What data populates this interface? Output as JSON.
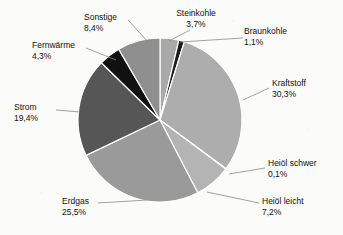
{
  "chart_data": {
    "type": "pie",
    "title": "",
    "subtitle": "",
    "xlabel": "",
    "ylabel": "",
    "grid": false,
    "legend_position": "none",
    "labels_outside": true,
    "start_angle_deg": 0,
    "direction": "clockwise",
    "unit": "%",
    "decimal_separator": ",",
    "categories": [
      "Steinkohle",
      "Braunkohle",
      "Kraftstoff",
      "Heiöl schwer",
      "Heiöl leicht",
      "Erdgas",
      "Strom",
      "Fernwärme",
      "Sonstige"
    ],
    "values": [
      3.7,
      1.1,
      30.3,
      0.1,
      7.2,
      25.5,
      19.4,
      4.3,
      8.4
    ],
    "value_labels": [
      "3,7%",
      "1,1%",
      "30,3%",
      "0,1%",
      "7,2%",
      "25,5%",
      "19,4%",
      "4,3%",
      "8,4%"
    ],
    "colors": [
      "#a9a9a9",
      "#1c1c1c",
      "#adadad",
      "#c8c8c8",
      "#b4b4b4",
      "#9a9a9a",
      "#565656",
      "#111111",
      "#8f8f8f"
    ],
    "slice_border_color": "#ffffff",
    "leader_line_color": "#8a8a8a",
    "total": 100.1
  },
  "slices": [
    {
      "name": "Steinkohle",
      "value_label": "3,7%",
      "color": "#a9a9a9",
      "label_pos": {
        "left": 196,
        "top": 8,
        "align": "center"
      },
      "leader": {
        "x1": 190,
        "y1": 30,
        "x2": 169,
        "y2": 41
      }
    },
    {
      "name": "Braunkohle",
      "value_label": "1,1%",
      "color": "#1c1c1c",
      "label_pos": {
        "left": 244,
        "top": 26,
        "align": "left"
      },
      "leader": {
        "x1": 243,
        "y1": 38,
        "x2": 180,
        "y2": 42
      }
    },
    {
      "name": "Kraftstoff",
      "value_label": "30,3%",
      "color": "#adadad",
      "label_pos": {
        "left": 272,
        "top": 78,
        "align": "left"
      },
      "leader": {
        "x1": 269,
        "y1": 88,
        "x2": 243,
        "y2": 100
      }
    },
    {
      "name": "Heiöl schwer",
      "value_label": "0,1%",
      "color": "#c8c8c8",
      "label_pos": {
        "left": 268,
        "top": 158,
        "align": "left"
      },
      "leader": {
        "x1": 265,
        "y1": 168,
        "x2": 229,
        "y2": 174
      }
    },
    {
      "name": "Heiöl leicht",
      "value_label": "7,2%",
      "color": "#b4b4b4",
      "label_pos": {
        "left": 262,
        "top": 196,
        "align": "left"
      },
      "leader": {
        "x1": 259,
        "y1": 203,
        "x2": 207,
        "y2": 192
      }
    },
    {
      "name": "Erdgas",
      "value_label": "25,5%",
      "color": "#9a9a9a",
      "label_pos": {
        "left": 62,
        "top": 196,
        "align": "left"
      },
      "leader": {
        "x1": 98,
        "y1": 203,
        "x2": 147,
        "y2": 200
      }
    },
    {
      "name": "Strom",
      "value_label": "19,4%",
      "color": "#565656",
      "label_pos": {
        "left": 14,
        "top": 102,
        "align": "left"
      },
      "leader": {
        "x1": 56,
        "y1": 110,
        "x2": 80,
        "y2": 112
      }
    },
    {
      "name": "Fernwärme",
      "value_label": "4,3%",
      "color": "#111111",
      "label_pos": {
        "left": 32,
        "top": 40,
        "align": "left"
      },
      "leader": {
        "x1": 86,
        "y1": 48,
        "x2": 116,
        "y2": 60
      }
    },
    {
      "name": "Sonstige",
      "value_label": "8,4%",
      "color": "#8f8f8f",
      "label_pos": {
        "left": 84,
        "top": 12,
        "align": "left"
      },
      "leader": {
        "x1": 128,
        "y1": 20,
        "x2": 148,
        "y2": 42
      }
    }
  ],
  "geometry": {
    "cx": 160,
    "cy": 120,
    "r": 82
  }
}
